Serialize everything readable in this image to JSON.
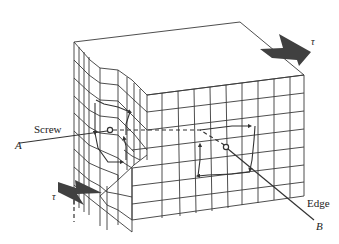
{
  "figure": {
    "labels": {
      "screw": "Screw",
      "edge": "Edge",
      "point_a": "A",
      "point_b": "B",
      "shear_top": "τ",
      "shear_bottom": "τ"
    },
    "colors": {
      "line": "#3a3a3a",
      "arrow_fill": "#404040",
      "background": "#ffffff"
    }
  }
}
